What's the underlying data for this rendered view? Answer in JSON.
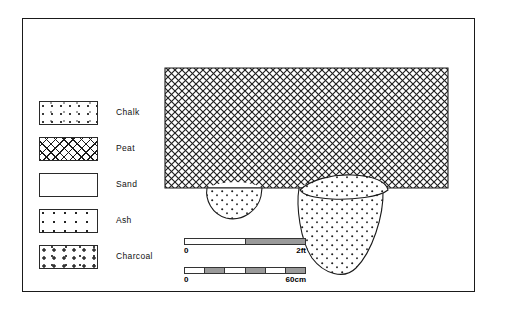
{
  "legend": {
    "items": [
      {
        "label": "Chalk",
        "pattern": "chalk-hatch-swatch"
      },
      {
        "label": "Peat",
        "pattern": "peat-crosshatch-swatch"
      },
      {
        "label": "Sand",
        "pattern": "sand-stipple-swatch"
      },
      {
        "label": "Ash",
        "pattern": "ash-dots-swatch"
      },
      {
        "label": "Charcoal",
        "pattern": "charcoal-blobs-swatch"
      }
    ]
  },
  "section": {
    "peat_layer": "Peat",
    "left_feature_fill": "Ash",
    "right_feature_upper_fill": "Ash",
    "right_feature_main_fill": "Ash"
  },
  "scales": [
    {
      "name": "imperial",
      "start_label": "0",
      "end_label": "2ft",
      "segments": [
        {
          "filled": false
        },
        {
          "filled": true
        }
      ]
    },
    {
      "name": "metric",
      "start_label": "0",
      "end_label": "60cm",
      "segments": [
        {
          "filled": false
        },
        {
          "filled": true
        },
        {
          "filled": false
        },
        {
          "filled": true
        },
        {
          "filled": false
        },
        {
          "filled": true
        }
      ]
    }
  ],
  "colors": {
    "ink": "#1a1a1a",
    "frame": "#1a1a1a",
    "fill_gray": "#9a9a9a",
    "paper": "#ffffff"
  }
}
